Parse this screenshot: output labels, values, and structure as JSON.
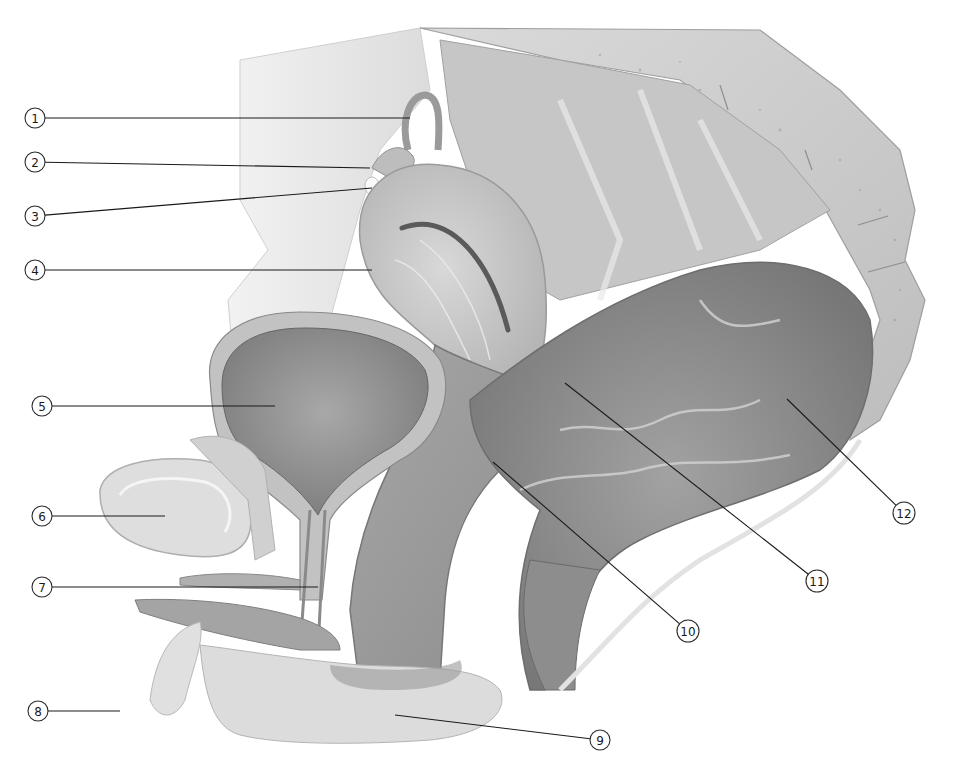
{
  "figure": {
    "type": "anatomical-illustration",
    "palette": {
      "background": "#ffffff",
      "line": "#1a1a1a",
      "light_tissue": "#e2e2e2",
      "mid_tissue": "#b8b8b8",
      "dark_tissue": "#8a8a8a",
      "bone": "#d4d4d4"
    }
  },
  "callouts": [
    {
      "n": "1",
      "label_x": 35,
      "label_y": 118,
      "line_to": [
        410,
        118
      ]
    },
    {
      "n": "2",
      "label_x": 35,
      "label_y": 162,
      "line_to": [
        370,
        168
      ]
    },
    {
      "n": "3",
      "label_x": 35,
      "label_y": 216,
      "line_to": [
        372,
        188
      ]
    },
    {
      "n": "4",
      "label_x": 35,
      "label_y": 270,
      "line_to": [
        372,
        270
      ]
    },
    {
      "n": "5",
      "label_x": 42,
      "label_y": 406,
      "line_to": [
        275,
        406
      ]
    },
    {
      "n": "6",
      "label_x": 42,
      "label_y": 516,
      "line_to": [
        165,
        516
      ]
    },
    {
      "n": "7",
      "label_x": 42,
      "label_y": 587,
      "line_to": [
        318,
        587
      ]
    },
    {
      "n": "8",
      "label_x": 38,
      "label_y": 711,
      "line_to": [
        120,
        711
      ]
    },
    {
      "n": "9",
      "label_x": 600,
      "label_y": 740,
      "line_to": [
        395,
        715
      ]
    },
    {
      "n": "10",
      "label_x": 688,
      "label_y": 631,
      "line_to": [
        493,
        462
      ]
    },
    {
      "n": "11",
      "label_x": 817,
      "label_y": 581,
      "line_to": [
        565,
        383
      ]
    },
    {
      "n": "12",
      "label_x": 904,
      "label_y": 513,
      "line_to": [
        787,
        399
      ]
    }
  ]
}
